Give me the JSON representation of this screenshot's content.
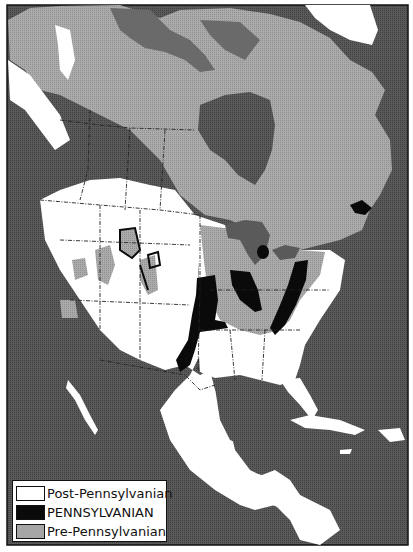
{
  "map": {
    "subject": "North America geologic map",
    "colors": {
      "ocean": "#555555",
      "pre_pennsylvanian": "#a6a6a6",
      "pre_pennsylvanian_dark": "#6e6e6e",
      "pennsylvanian": "#0a0a0a",
      "post_pennsylvanian": "#ffffff",
      "border": "#111111"
    }
  },
  "legend": {
    "items": [
      {
        "label": "Post-Pennsylvanian",
        "color": "#ffffff"
      },
      {
        "label": "PENNSYLVANIAN",
        "color": "#0a0a0a"
      },
      {
        "label": "Pre-Pennsylvanian",
        "color": "#a6a6a6"
      }
    ]
  }
}
